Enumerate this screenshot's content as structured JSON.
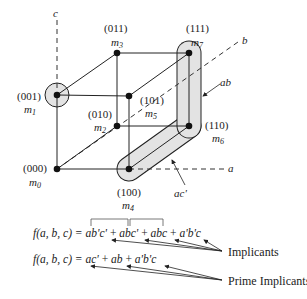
{
  "diagram": {
    "type": "boolean-3-cube",
    "axes": {
      "a": "a",
      "b": "b",
      "c": "c"
    },
    "nodes": [
      {
        "id": "m0",
        "code": "(000)",
        "name": "m",
        "sub": "0"
      },
      {
        "id": "m1",
        "code": "(001)",
        "name": "m",
        "sub": "1"
      },
      {
        "id": "m2",
        "code": "(010)",
        "name": "m",
        "sub": "2"
      },
      {
        "id": "m3",
        "code": "(011)",
        "name": "m",
        "sub": "3"
      },
      {
        "id": "m4",
        "code": "(100)",
        "name": "m",
        "sub": "4"
      },
      {
        "id": "m5",
        "code": "(101)",
        "name": "m",
        "sub": "5"
      },
      {
        "id": "m6",
        "code": "(110)",
        "name": "m",
        "sub": "6"
      },
      {
        "id": "m7",
        "code": "(111)",
        "name": "m",
        "sub": "7"
      }
    ],
    "groupings": {
      "ab": "ab",
      "ac_prime": "ac'"
    },
    "equations": {
      "implicants": {
        "lhs": "f(a, b, c) = ",
        "terms": [
          "ab'c'",
          "abc'",
          "abc",
          "a'b'c"
        ],
        "plus": " + "
      },
      "prime_implicants": {
        "lhs": "f(a, b, c) = ",
        "terms": [
          "ac'",
          "ab",
          "a'b'c"
        ],
        "plus": " + "
      }
    },
    "annotations": {
      "implicants_label": "Implicants",
      "prime_implicants_label": "Prime Implicants"
    },
    "colors": {
      "highlight_fill": "#e3e3e3",
      "line": "#222222",
      "node": "#111111"
    }
  }
}
